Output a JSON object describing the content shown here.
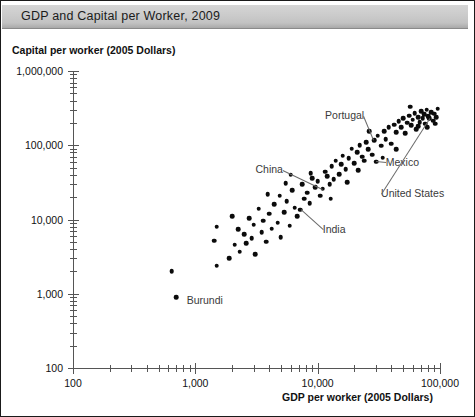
{
  "figure": {
    "title": "GDP and Capital per Worker, 2009",
    "border_color": "#1a1a1a",
    "title_bar_color": "#c8c8c8",
    "dot_color": "#0b0b0b",
    "axis_color": "#555555"
  },
  "chart_data": {
    "type": "scatter",
    "title": "GDP and Capital per Worker, 2009",
    "xlabel": "GDP per worker (2005 Dollars)",
    "ylabel": "Capital per worker (2005 Dollars)",
    "xscale": "log",
    "yscale": "log",
    "xlim": [
      100,
      100000
    ],
    "ylim": [
      100,
      1000000
    ],
    "grid": false,
    "legend": null,
    "xticks": [
      100,
      1000,
      10000,
      100000
    ],
    "xticklabels": [
      "100",
      "1,000",
      "10,000",
      "100,000"
    ],
    "yticks": [
      100,
      1000,
      10000,
      100000,
      1000000
    ],
    "yticklabels": [
      "100",
      "1,000",
      "10,000",
      "100,000",
      "1,000,000"
    ],
    "minor_ticks": true,
    "annotations": [
      {
        "label": "Portugal",
        "x": 29000,
        "y": 118000,
        "align": "right",
        "text_x": 24000,
        "text_y": 250000
      },
      {
        "label": "Mexico",
        "x": 30000,
        "y": 60000,
        "align": "left",
        "text_x": 36000,
        "text_y": 58000
      },
      {
        "label": "China",
        "x": 11000,
        "y": 26000,
        "align": "right",
        "text_x": 5200,
        "text_y": 47000
      },
      {
        "label": "India",
        "x": 7200,
        "y": 13500,
        "align": "left",
        "text_x": 11000,
        "text_y": 7200
      },
      {
        "label": "United States",
        "x": 82000,
        "y": 230000,
        "align": "left",
        "text_x": 33000,
        "text_y": 22000
      },
      {
        "label": "Burundi",
        "x": 700,
        "y": 900,
        "align": "left",
        "text_x": 850,
        "text_y": 800
      }
    ],
    "points": [
      [
        700,
        900
      ],
      [
        640,
        2000
      ],
      [
        1500,
        2400
      ],
      [
        1430,
        5200
      ],
      [
        1500,
        8000
      ],
      [
        1900,
        3000
      ],
      [
        2100,
        4600
      ],
      [
        2000,
        11000
      ],
      [
        2300,
        3700
      ],
      [
        2500,
        6300
      ],
      [
        2600,
        4800
      ],
      [
        2750,
        10500
      ],
      [
        2900,
        5600
      ],
      [
        3000,
        8500
      ],
      [
        3100,
        3400
      ],
      [
        3300,
        14000
      ],
      [
        3500,
        6800
      ],
      [
        3600,
        9600
      ],
      [
        3800,
        5000
      ],
      [
        4000,
        12000
      ],
      [
        4200,
        7500
      ],
      [
        4400,
        16000
      ],
      [
        4700,
        9000
      ],
      [
        4900,
        21000
      ],
      [
        5000,
        5800
      ],
      [
        5300,
        12500
      ],
      [
        5600,
        17500
      ],
      [
        5900,
        8200
      ],
      [
        6200,
        25000
      ],
      [
        6500,
        14500
      ],
      [
        6800,
        11000
      ],
      [
        7200,
        13500
      ],
      [
        7500,
        30000
      ],
      [
        7800,
        19000
      ],
      [
        8200,
        23000
      ],
      [
        8600,
        16500
      ],
      [
        9000,
        36000
      ],
      [
        9500,
        27000
      ],
      [
        10000,
        33000
      ],
      [
        10500,
        21000
      ],
      [
        11000,
        26000
      ],
      [
        11500,
        44000
      ],
      [
        12000,
        38000
      ],
      [
        12500,
        30000
      ],
      [
        13000,
        52000
      ],
      [
        13500,
        35000
      ],
      [
        14000,
        62000
      ],
      [
        15000,
        41000
      ],
      [
        15500,
        56000
      ],
      [
        16000,
        72000
      ],
      [
        17000,
        48000
      ],
      [
        18000,
        67000
      ],
      [
        19000,
        90000
      ],
      [
        20000,
        57000
      ],
      [
        21000,
        80000
      ],
      [
        22000,
        100000
      ],
      [
        23000,
        70000
      ],
      [
        24000,
        62000
      ],
      [
        25000,
        110000
      ],
      [
        26000,
        88000
      ],
      [
        28000,
        75000
      ],
      [
        29000,
        118000
      ],
      [
        30000,
        60000
      ],
      [
        31000,
        135000
      ],
      [
        33000,
        98000
      ],
      [
        35000,
        155000
      ],
      [
        36000,
        120000
      ],
      [
        38000,
        175000
      ],
      [
        40000,
        105000
      ],
      [
        42000,
        190000
      ],
      [
        44000,
        150000
      ],
      [
        46000,
        210000
      ],
      [
        48000,
        175000
      ],
      [
        50000,
        230000
      ],
      [
        52000,
        145000
      ],
      [
        54000,
        200000
      ],
      [
        56000,
        250000
      ],
      [
        58000,
        185000
      ],
      [
        60000,
        220000
      ],
      [
        62000,
        270000
      ],
      [
        64000,
        165000
      ],
      [
        66000,
        240000
      ],
      [
        68000,
        205000
      ],
      [
        70000,
        285000
      ],
      [
        72000,
        230000
      ],
      [
        74000,
        260000
      ],
      [
        76000,
        195000
      ],
      [
        78000,
        300000
      ],
      [
        80000,
        245000
      ],
      [
        82000,
        230000
      ],
      [
        85000,
        280000
      ],
      [
        88000,
        215000
      ],
      [
        90000,
        265000
      ],
      [
        93000,
        240000
      ],
      [
        96000,
        310000
      ],
      [
        8800,
        42000
      ],
      [
        17500,
        32000
      ],
      [
        26500,
        155000
      ],
      [
        44000,
        88000
      ],
      [
        6000,
        40000
      ],
      [
        3900,
        22000
      ],
      [
        2250,
        7400
      ],
      [
        5500,
        31000
      ],
      [
        12800,
        19000
      ],
      [
        21500,
        46000
      ],
      [
        34000,
        68000
      ],
      [
        57000,
        330000
      ],
      [
        66000,
        180000
      ],
      [
        79000,
        175000
      ],
      [
        91000,
        195000
      ]
    ]
  }
}
